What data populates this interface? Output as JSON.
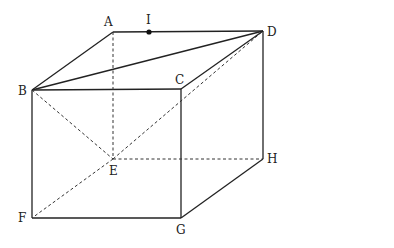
{
  "diagram": {
    "type": "rectangular-prism",
    "vertices": {
      "A": {
        "x": 113,
        "y": 32,
        "label": "A",
        "lx": 104,
        "ly": 26
      },
      "I": {
        "x": 149,
        "y": 32,
        "label": "I",
        "lx": 146,
        "ly": 24
      },
      "D": {
        "x": 263,
        "y": 31,
        "label": "D",
        "lx": 267,
        "ly": 36
      },
      "B": {
        "x": 32,
        "y": 90,
        "label": "B",
        "lx": 18,
        "ly": 95
      },
      "C": {
        "x": 181,
        "y": 89,
        "label": "C",
        "lx": 175,
        "ly": 84
      },
      "E": {
        "x": 113,
        "y": 159,
        "label": "E",
        "lx": 109,
        "ly": 175
      },
      "H": {
        "x": 263,
        "y": 159,
        "label": "H",
        "lx": 267,
        "ly": 163
      },
      "F": {
        "x": 32,
        "y": 218,
        "label": "F",
        "lx": 18,
        "ly": 222
      },
      "G": {
        "x": 181,
        "y": 218,
        "label": "G",
        "lx": 176,
        "ly": 234
      }
    },
    "solid_edges": [
      [
        "A",
        "D"
      ],
      [
        "A",
        "B"
      ],
      [
        "B",
        "D"
      ],
      [
        "B",
        "C"
      ],
      [
        "C",
        "D"
      ],
      [
        "D",
        "H"
      ],
      [
        "B",
        "F"
      ],
      [
        "F",
        "G"
      ],
      [
        "C",
        "G"
      ],
      [
        "G",
        "H"
      ]
    ],
    "dashed_edges": [
      [
        "A",
        "E"
      ],
      [
        "B",
        "E"
      ],
      [
        "E",
        "D"
      ],
      [
        "E",
        "H"
      ],
      [
        "E",
        "F"
      ]
    ],
    "marked_points": [
      "I"
    ]
  }
}
